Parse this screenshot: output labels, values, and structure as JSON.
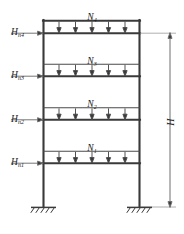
{
  "figure": {
    "type": "structural-frame-load-diagram",
    "stroke_color": "#3a3a3a",
    "thin_color": "#6e6e6e",
    "text_color": "#1a1a1a",
    "background": "#ffffff"
  },
  "lateral_loads": [
    {
      "symbol": "H",
      "subscript": "n4",
      "storey": 4,
      "y": 33
    },
    {
      "symbol": "H",
      "subscript": "n3",
      "storey": 3,
      "y": 76
    },
    {
      "symbol": "H",
      "subscript": "n2",
      "storey": 2,
      "y": 120
    },
    {
      "symbol": "H",
      "subscript": "n1",
      "storey": 1,
      "y": 163
    }
  ],
  "vertical_loads": [
    {
      "symbol": "N",
      "subscript": "4",
      "storey": 4,
      "arrows": 5,
      "beam_y": 33,
      "line_y": 21
    },
    {
      "symbol": "N",
      "subscript": "3",
      "storey": 3,
      "arrows": 5,
      "beam_y": 76,
      "line_y": 64
    },
    {
      "symbol": "N",
      "subscript": "2",
      "storey": 2,
      "arrows": 5,
      "beam_y": 120,
      "line_y": 108
    },
    {
      "symbol": "N",
      "subscript": "1",
      "storey": 1,
      "arrows": 5,
      "beam_y": 163,
      "line_y": 151
    }
  ],
  "dimension": {
    "symbol": "H",
    "subscript": "",
    "meaning": "total frame height",
    "x": 170,
    "y_top": 33,
    "y_bottom": 207
  },
  "supports": [
    {
      "type": "fixed",
      "label": "fixed-support-left",
      "x": 43,
      "y": 207
    },
    {
      "type": "fixed",
      "label": "fixed-support-right",
      "x": 140,
      "y": 207
    }
  ],
  "geometry": {
    "left_column_x": 43,
    "right_column_x": 140,
    "top_y": 21,
    "base_y": 207
  }
}
